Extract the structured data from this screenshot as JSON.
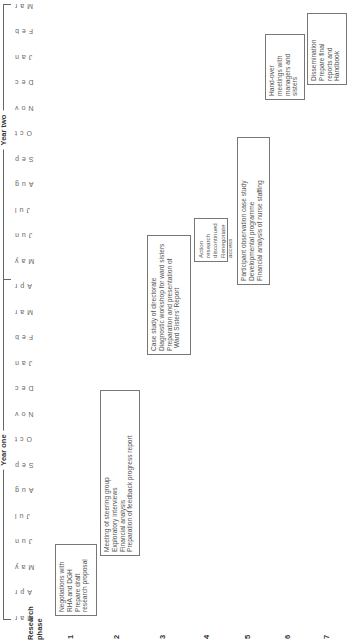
{
  "header": {
    "research_phase_label": "Research phase",
    "years": [
      {
        "label": "Year one"
      },
      {
        "label": "Year two"
      }
    ],
    "months": [
      "Mar",
      "Apr",
      "May",
      "Jun",
      "Jul",
      "Aug",
      "Sep",
      "Oct",
      "Nov",
      "Dec",
      "Jan",
      "Feb",
      "Mar",
      "Apr",
      "May",
      "Jun",
      "Jul",
      "Aug",
      "Sep",
      "Oct",
      "Nov",
      "Dec",
      "Jan",
      "Feb",
      "Mar"
    ]
  },
  "phases": [
    {
      "number": "1",
      "lines": [
        "Negotiations with",
        "RHA and DGH",
        "Prepare draft",
        "research proposal"
      ]
    },
    {
      "number": "2",
      "lines": [
        "Meeting of steering group",
        "Exploratory interviews",
        "Financial analysis",
        "Preparation of feedback progress report"
      ]
    },
    {
      "number": "3",
      "lines": [
        "Case study of directorate",
        "Diagnostic workshop for ward sisters",
        "Preparation and presentation of",
        "Ward Sisters' Report"
      ]
    },
    {
      "number": "4",
      "lines": [
        "Action research",
        "discontinued",
        "Renegotiate",
        "access"
      ]
    },
    {
      "number": "5",
      "lines": [
        "Participant observation case study",
        "Developmental programme",
        "Financial analysis of nurse staffing"
      ]
    },
    {
      "number": "6",
      "lines": [
        "Hand-over",
        "meetings with",
        "managers and",
        "sisters"
      ]
    },
    {
      "number": "7",
      "lines": [
        "Dissemination",
        "Prepare final",
        "reports and",
        "Handbook"
      ]
    }
  ]
}
